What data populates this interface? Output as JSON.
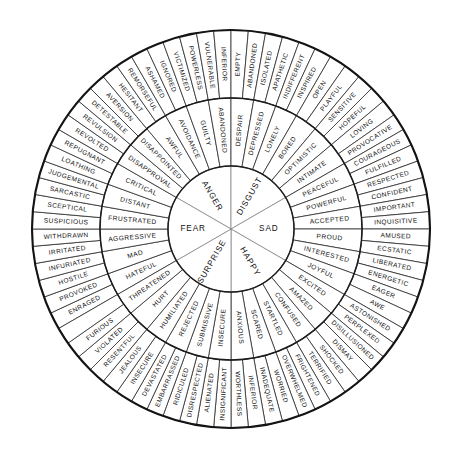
{
  "colors": {
    "background": "#ffffff",
    "stroke": "#2b2b2b",
    "rim": "#141414",
    "text": "#111111",
    "core_divider": "#7a7a7a"
  },
  "geometry": {
    "center_x": 231,
    "center_y": 229,
    "radius_core": 63,
    "radius_middle": 131,
    "radius_outer": 199,
    "start_angle_deg": -120,
    "core_count": 6,
    "middle_per_core": 4,
    "outer_per_core": 8
  },
  "chart_data": {
    "type": "pie",
    "rings": [
      "core",
      "middle",
      "outer"
    ],
    "core": [
      "FEAR",
      "ANGER",
      "DISGUST",
      "SAD",
      "HAPPY",
      "SURPRISE"
    ],
    "middle": [
      "HUMILIATED",
      "REJECTED",
      "SUBMISSIVE",
      "INSECURE",
      "ANXIOUS",
      "SCARED",
      "STARTLED",
      "CONFUSED",
      "AMAZED",
      "EXCITED",
      "JOYFUL",
      "INTERESTED",
      "PROUD",
      "ACCEPTED",
      "POWERFUL",
      "PEACEFUL",
      "INTIMATE",
      "OPTIMISTIC",
      "BORED",
      "LONELY",
      "DEPRESSED",
      "DESPAIR",
      "ABANDONED",
      "GUILTY",
      "AVOIDANCE",
      "AWFUL",
      "DISAPPOINTED",
      "DISAPPROVAL",
      "CRITICAL",
      "DISTANT",
      "FRUSTRATED",
      "AGGRESSIVE",
      "MAD",
      "HATEFUL",
      "THREATENED",
      "HURT"
    ],
    "outer": [
      "DISRESPECTED",
      "RIDICULED",
      "EMBARRASSED",
      "DEVASTATED",
      "INSECURE",
      "JEALOUS",
      "RESENTFUL",
      "VIOLATED",
      "FURIOUS",
      "ENRAGED",
      "PROVOKED",
      "HOSTILE",
      "INFURIATED",
      "IRRITATED",
      "WITHDRAWN",
      "SUSPICIOUS",
      "SCEPTICAL",
      "SARCASTIC",
      "JUDGEMENTAL",
      "LOATHING",
      "REPUGNANT",
      "REVOLTED",
      "REVULSION",
      "DETESTABLE",
      "AVERSION",
      "HESITANT",
      "REMORSEFUL",
      "ASHAMED",
      "IGNORED",
      "VICTIMIZED",
      "POWERLESS",
      "VULNERABLE",
      "INFERIOR",
      "EMPTY",
      "ABANDONED",
      "ISOLATED",
      "APATHETIC",
      "INDIFFERENT",
      "INSPIRED",
      "OPEN",
      "PLAYFUL",
      "SENSITIVE",
      "HOPEFUL",
      "LOVING",
      "PROVOCATIVE",
      "COURAGEOUS",
      "FULFILLED",
      "RESPECTED",
      "CONFIDENT",
      "IMPORTANT",
      "INQUISITIVE",
      "AMUSED",
      "ECSTATIC",
      "LIBERATED",
      "ENERGETIC",
      "EAGER",
      "AWE",
      "ASTONISHED",
      "PERPLEXED",
      "DISILLUSIONED",
      "DISMAY",
      "SHOCKED",
      "TERRIFIED",
      "FRIGHTENED",
      "OVERWHELMED",
      "WORRIED",
      "INADEQUATE",
      "INFERIOR",
      "WORTHLESS",
      "INSIGNIFICANT",
      "ALIENATED"
    ]
  },
  "wheel": {
    "sectors": [
      {
        "core": "FEAR",
        "middle": [
          "SCARED",
          "ANXIOUS",
          "INSECURE",
          "SUBMISSIVE"
        ],
        "outer": [
          "OVERWHELMED",
          "WORRIED",
          "INADEQUATE",
          "INFERIOR",
          "WORTHLESS",
          "INSIGNIFICANT",
          "ALIENATED",
          "DISRESPECTED"
        ]
      },
      {
        "core": "ANGER",
        "middle": [
          "REJECTED",
          "HUMILIATED",
          "HURT",
          "THREATENED"
        ],
        "outer": [
          "RIDICULED",
          "EMBARRASSED",
          "DEVASTATED",
          "INSECURE",
          "JEALOUS",
          "RESENTFUL",
          "VIOLATED",
          "FURIOUS"
        ]
      },
      {
        "core": "ANGER2",
        "middle": [
          "HATEFUL",
          "MAD",
          "AGGRESSIVE",
          "FRUSTRATED"
        ],
        "outer": [
          "ENRAGED",
          "PROVOKED",
          "HOSTILE",
          "INFURIATED",
          "IRRITATED",
          "WITHDRAWN",
          "SUSPICIOUS",
          "SCEPTICAL"
        ]
      },
      {
        "core": "DISGUST",
        "middle": [
          "DISTANT",
          "CRITICAL",
          "DISAPPROVAL",
          "DISAPPOINTED"
        ],
        "outer": [
          "SARCASTIC",
          "JUDGEMENTAL",
          "LOATHING",
          "REPUGNANT",
          "REVOLTED",
          "REVULSION",
          "DETESTABLE",
          "AVERSION"
        ]
      },
      {
        "core": "DISGUST2",
        "middle": [
          "AWFUL",
          "AVOIDANCE",
          "GUILTY",
          "ABANDONED"
        ],
        "outer": [
          "HESITANT",
          "REMORSEFUL",
          "ASHAMED",
          "IGNORED",
          "VICTIMIZED",
          "POWERLESS",
          "VULNERABLE",
          "INFERIOR"
        ]
      },
      {
        "core": "SAD",
        "middle": [
          "DESPAIR",
          "DEPRESSED",
          "LONELY",
          "BORED"
        ],
        "outer": [
          "EMPTY",
          "ABANDONED",
          "ISOLATED",
          "APATHETIC",
          "INDIFFERENT",
          "INSPIRED",
          "OPEN",
          "PLAYFUL"
        ]
      },
      {
        "core": "HAPPY",
        "middle": [
          "OPTIMISTIC",
          "INTIMATE",
          "PEACEFUL",
          "POWERFUL"
        ],
        "outer": [
          "SENSITIVE",
          "HOPEFUL",
          "LOVING",
          "PROVOCATIVE",
          "COURAGEOUS",
          "FULFILLED",
          "RESPECTED",
          "CONFIDENT"
        ]
      },
      {
        "core": "HAPPY2",
        "middle": [
          "ACCEPTED",
          "PROUD",
          "INTERESTED",
          "JOYFUL"
        ],
        "outer": [
          "IMPORTANT",
          "INQUISITIVE",
          "AMUSED",
          "ECSTATIC",
          "LIBERATED",
          "ENERGETIC",
          "EAGER",
          "AWE"
        ]
      },
      {
        "core": "SURPRISE",
        "middle": [
          "EXCITED",
          "AMAZED",
          "CONFUSED",
          "STARTLED"
        ],
        "outer": [
          "ASTONISHED",
          "PERPLEXED",
          "DISILLUSIONED",
          "DISMAY",
          "SHOCKED",
          "TERRIFIED",
          "FRIGHTENED",
          "OVERWHELMED"
        ]
      }
    ],
    "core_labels": [
      "FEAR",
      "ANGER",
      "DISGUST",
      "SAD",
      "HAPPY",
      "SURPRISE"
    ],
    "middle_labels_cw_from_top": [
      "HATEFUL",
      "MAD",
      "AGGRESSIVE",
      "FRUSTRATED",
      "DISTANT",
      "CRITICAL",
      "DISAPPROVAL",
      "DISAPPOINTED",
      "AWFUL",
      "AVOIDANCE",
      "GUILTY",
      "ABANDONED",
      "DESPAIR",
      "DEPRESSED",
      "LONELY",
      "BORED",
      "OPTIMISTIC",
      "INTIMATE",
      "PEACEFUL",
      "POWERFUL",
      "ACCEPTED",
      "PROUD",
      "INTERESTED",
      "JOYFUL",
      "EXCITED",
      "AMAZED",
      "CONFUSED",
      "STARTLED",
      "SCARED",
      "ANXIOUS",
      "INSECURE",
      "SUBMISSIVE",
      "REJECTED",
      "HUMILIATED",
      "HURT",
      "THREATENED"
    ],
    "outer_labels_cw_from_top": [
      "ENRAGED",
      "PROVOKED",
      "HOSTILE",
      "INFURIATED",
      "IRRITATED",
      "WITHDRAWN",
      "SUSPICIOUS",
      "SCEPTICAL",
      "SARCASTIC",
      "JUDGEMENTAL",
      "LOATHING",
      "REPUGNANT",
      "REVOLTED",
      "REVULSION",
      "DETESTABLE",
      "AVERSION",
      "HESITANT",
      "REMORSEFUL",
      "ASHAMED",
      "IGNORED",
      "VICTIMIZED",
      "POWERLESS",
      "VULNERABLE",
      "INFERIOR",
      "EMPTY",
      "ABANDONED",
      "ISOLATED",
      "APATHETIC",
      "INDIFFERENT",
      "INSPIRED",
      "OPEN",
      "PLAYFUL",
      "SENSITIVE",
      "HOPEFUL",
      "LOVING",
      "PROVOCATIVE",
      "COURAGEOUS",
      "FULFILLED",
      "RESPECTED",
      "CONFIDENT",
      "IMPORTANT",
      "INQUISITIVE",
      "AMUSED",
      "ECSTATIC",
      "LIBERATED",
      "ENERGETIC",
      "EAGER",
      "AWE",
      "ASTONISHED",
      "PERPLEXED",
      "DISILLUSIONED",
      "DISMAY",
      "SHOCKED",
      "TERRIFIED",
      "FRIGHTENED",
      "OVERWHELMED",
      "WORRIED",
      "INADEQUATE",
      "INFERIOR",
      "WORTHLESS",
      "INSIGNIFICANT",
      "ALIENATED",
      "DISRESPECTED",
      "RIDICULED",
      "EMBARRASSED",
      "DEVASTATED",
      "INSECURE",
      "JEALOUS",
      "RESENTFUL",
      "VIOLATED",
      "FURIOUS"
    ]
  }
}
